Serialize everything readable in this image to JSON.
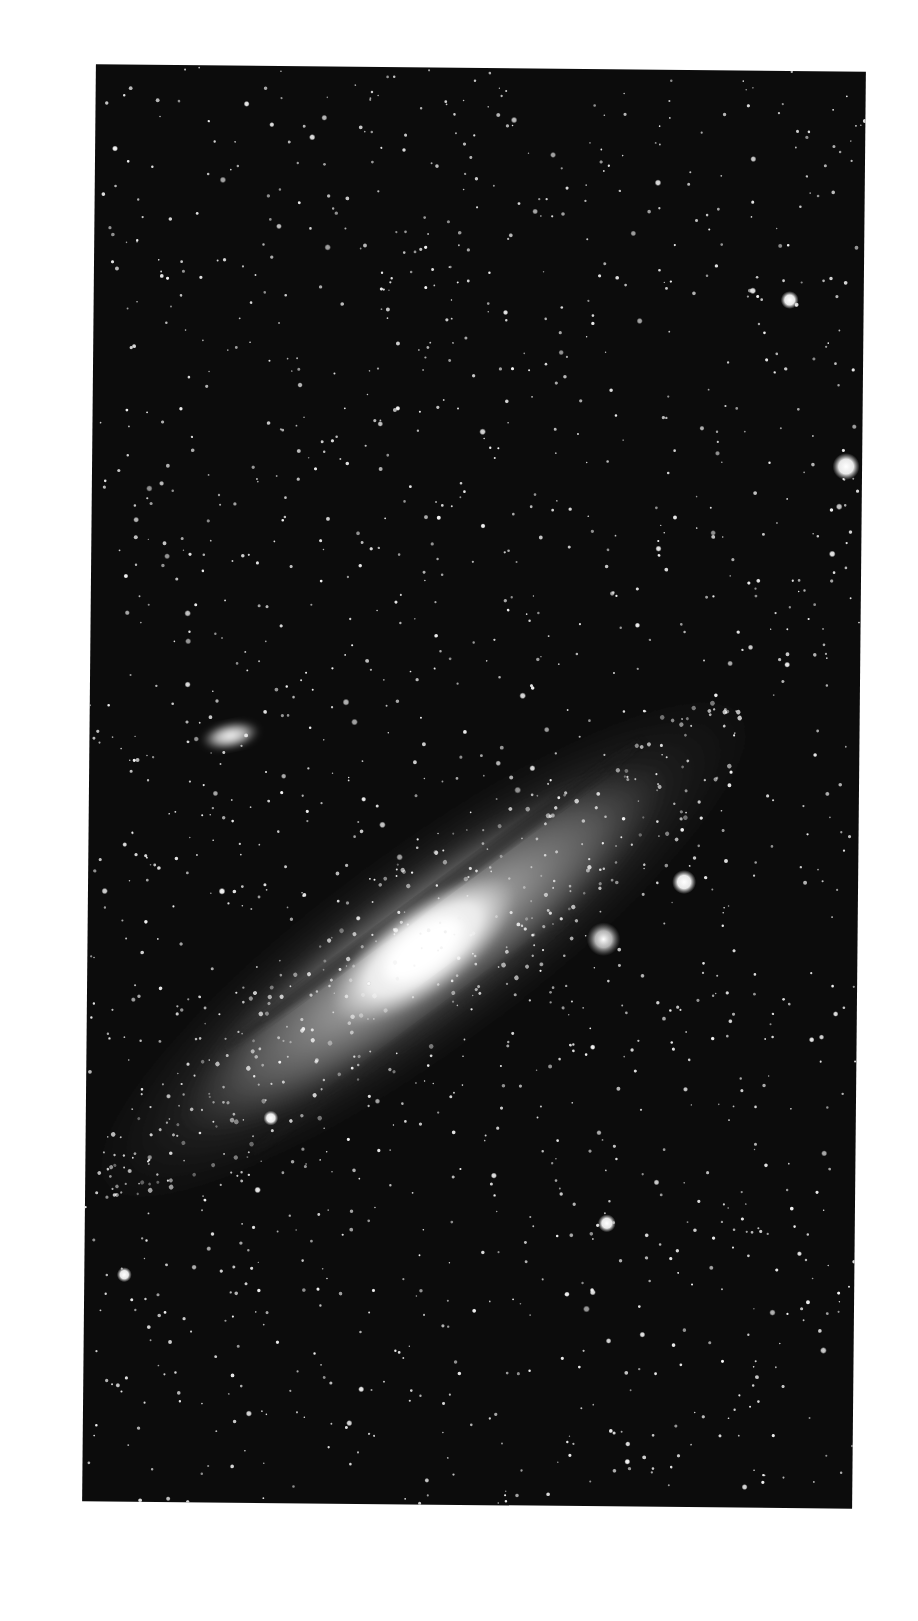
{
  "image": {
    "subject": "Andromeda Galaxy (spiral galaxy) with satellite galaxies",
    "style": "black-and-white astrophotograph",
    "background_color": "#ffffff",
    "plate_color": "#0c0c0c"
  },
  "plate": {
    "left": 89,
    "top": 68,
    "width": 770,
    "height": 1437,
    "rotation_deg": 0.55
  },
  "galaxy": {
    "name": "main-spiral-galaxy",
    "center": [
      336,
      882
    ],
    "angle_deg": -37,
    "halo": {
      "rx": 420,
      "ry": 105
    },
    "disk": {
      "rx": 300,
      "ry": 70
    },
    "core": {
      "rx": 110,
      "ry": 45
    },
    "nucleus": {
      "rx": 45,
      "ry": 22
    },
    "dust_lane_offset": -38
  },
  "companions": [
    {
      "name": "elliptical-companion-upper-left",
      "cx": 141,
      "cy": 670,
      "rx": 30,
      "ry": 14,
      "angle_deg": -12
    },
    {
      "name": "compact-companion-near-core",
      "cx": 516,
      "cy": 870,
      "r": 12
    }
  ],
  "bright_stars": [
    {
      "cx": 596,
      "cy": 812,
      "r": 8
    },
    {
      "cx": 754,
      "cy": 395,
      "r": 9
    },
    {
      "cx": 696,
      "cy": 229,
      "r": 6
    },
    {
      "cx": 522,
      "cy": 1154,
      "r": 6
    },
    {
      "cx": 185,
      "cy": 1052,
      "r": 5
    },
    {
      "cx": 40,
      "cy": 1210,
      "r": 5
    }
  ],
  "star_field": {
    "count": 1500,
    "seed": 7
  }
}
